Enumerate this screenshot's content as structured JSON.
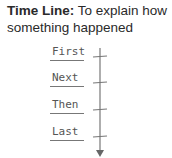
{
  "title": {
    "bold": "Time Line:",
    "text": " To explain how something happened"
  },
  "timeline": {
    "steps": [
      {
        "label": "First"
      },
      {
        "label": "Next"
      },
      {
        "label": "Then"
      },
      {
        "label": "Last"
      }
    ],
    "line_color": "#777777"
  }
}
